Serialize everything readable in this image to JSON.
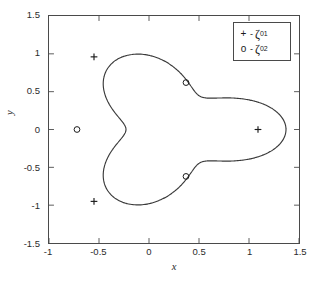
{
  "chart_data": {
    "type": "line",
    "title": "",
    "xlabel": "x",
    "ylabel": "y",
    "xlim": [
      -1,
      1.5
    ],
    "ylim": [
      -1.5,
      1.5
    ],
    "xticks": [
      "-1",
      "-0.5",
      "0",
      "0.5",
      "1",
      "1.5"
    ],
    "xtick_values": [
      -1,
      -0.5,
      0,
      0.5,
      1,
      1.5
    ],
    "yticks": [
      "1.5",
      "1",
      "0.5",
      "0",
      "-0.5",
      "-1",
      "-1.5"
    ],
    "ytick_values": [
      1.5,
      1,
      0.5,
      0,
      -0.5,
      -1,
      -1.5
    ],
    "grid": false,
    "legend_position": "upper-right",
    "legend": [
      {
        "marker": "+",
        "dash": "-",
        "symbol": "ζ",
        "subscript": "01",
        "label": "+ - ζ₀₁"
      },
      {
        "marker": "o",
        "dash": "-",
        "symbol": "ζ",
        "subscript": "02",
        "label": "o - ζ₀₂"
      }
    ],
    "series": [
      {
        "name": "domain-boundary",
        "type": "closed-curve",
        "color": "#3a3a3a",
        "linewidth": 1.1,
        "description": "three-lobed (trefoil) closed contour, 3-fold symmetric about center (0.27, 0.0)",
        "center": [
          0.27,
          0.0
        ],
        "r_max": 1.1,
        "r_min": 0.5,
        "lobe_angles_deg": [
          0,
          120,
          240
        ]
      },
      {
        "name": "zeta01-markers",
        "type": "scatter",
        "marker": "+",
        "color": "#1a1a1a",
        "points": [
          {
            "x": -0.55,
            "y": 0.96
          },
          {
            "x": 1.09,
            "y": 0.0
          },
          {
            "x": -0.55,
            "y": -0.95
          }
        ]
      },
      {
        "name": "zeta02-markers",
        "type": "scatter",
        "marker": "o",
        "color": "#1a1a1a",
        "points": [
          {
            "x": 0.37,
            "y": 0.62
          },
          {
            "x": -0.72,
            "y": 0.0
          },
          {
            "x": 0.37,
            "y": -0.62
          }
        ]
      }
    ]
  },
  "axes": {
    "x_title": "x",
    "y_title": "y",
    "x_ticks": [
      {
        "label": "-1"
      },
      {
        "label": "-0.5"
      },
      {
        "label": "0"
      },
      {
        "label": "0.5"
      },
      {
        "label": "1"
      },
      {
        "label": "1.5"
      }
    ],
    "y_ticks": [
      {
        "label": "1.5"
      },
      {
        "label": "1"
      },
      {
        "label": "0.5"
      },
      {
        "label": "0"
      },
      {
        "label": "-0.5"
      },
      {
        "label": "-1"
      },
      {
        "label": "-1.5"
      }
    ]
  },
  "legend": {
    "entries": [
      {
        "marker": "+",
        "separator": "-",
        "symbol": "ζ",
        "subscript": "01"
      },
      {
        "marker": "o",
        "separator": "-",
        "symbol": "ζ",
        "subscript": "02"
      }
    ]
  },
  "colors": {
    "curve": "#3a3a3a",
    "axis": "#4a4a4a",
    "marker": "#1a1a1a",
    "text": "#2b2b2b",
    "background": "#ffffff"
  }
}
